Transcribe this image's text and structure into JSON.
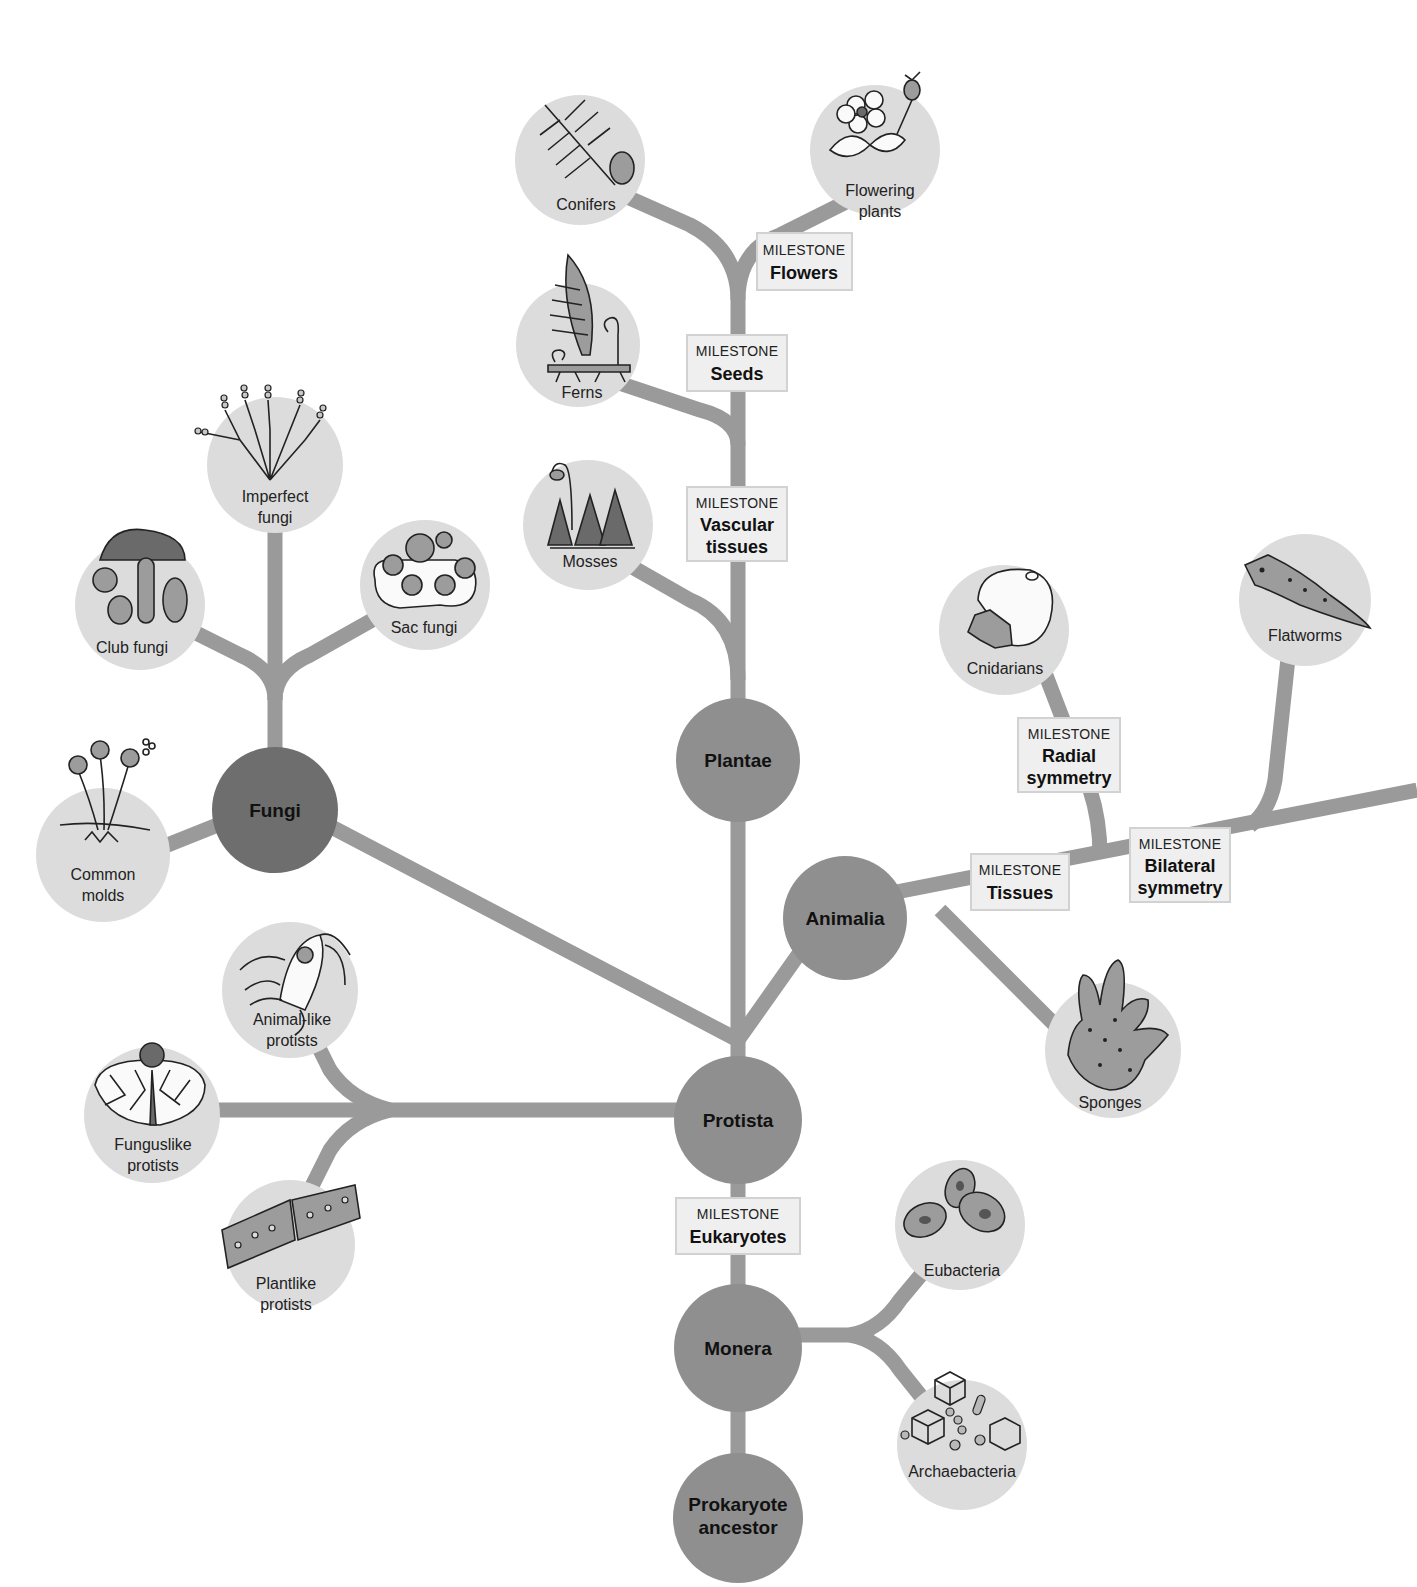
{
  "diagram": {
    "type": "phylogenetic-tree",
    "colors": {
      "kingdom_node": "#8f8f8f",
      "fungi_node": "#6e6e6e",
      "group_node": "#dcdcdc",
      "branch": "#9a9a9a",
      "milestone_box": "#efefef"
    },
    "kingdoms": {
      "plantae": "Plantae",
      "animalia": "Animalia",
      "fungi": "Fungi",
      "protista": "Protista",
      "monera": "Monera",
      "ancestor_line1": "Prokaryote",
      "ancestor_line2": "ancestor"
    },
    "groups": {
      "conifers": "Conifers",
      "flowering_line1": "Flowering",
      "flowering_line2": "plants",
      "ferns": "Ferns",
      "mosses": "Mosses",
      "imperfect_line1": "Imperfect",
      "imperfect_line2": "fungi",
      "club_fungi": "Club fungi",
      "sac_fungi": "Sac fungi",
      "molds_line1": "Common",
      "molds_line2": "molds",
      "cnidarians": "Cnidarians",
      "flatworms": "Flatworms",
      "sponges": "Sponges",
      "animal_protists_line1": "Animal-like",
      "animal_protists_line2": "protists",
      "fungus_protists_line1": "Funguslike",
      "fungus_protists_line2": "protists",
      "plant_protists_line1": "Plantlike",
      "plant_protists_line2": "protists",
      "eubacteria": "Eubacteria",
      "archaebacteria": "Archaebacteria"
    },
    "milestones": {
      "header": "MILESTONE",
      "flowers": "Flowers",
      "seeds": "Seeds",
      "vascular_line1": "Vascular",
      "vascular_line2": "tissues",
      "radial_line1": "Radial",
      "radial_line2": "symmetry",
      "bilateral_line1": "Bilateral",
      "bilateral_line2": "symmetry",
      "tissues": "Tissues",
      "eukaryotes": "Eukaryotes"
    }
  }
}
